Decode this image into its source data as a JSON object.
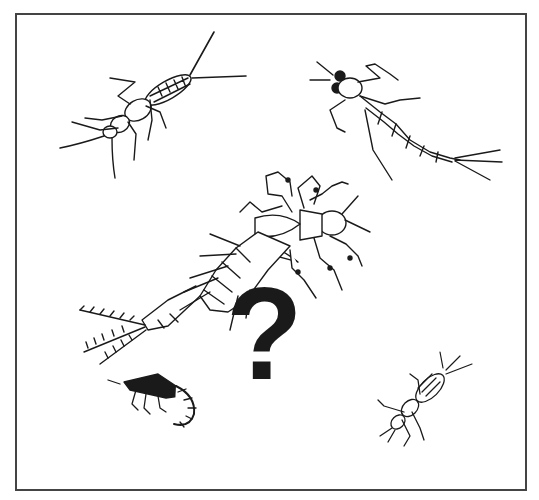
{
  "figure": {
    "symbol": "?",
    "colors": {
      "ink": "#1a1a1a",
      "frame": "#444444",
      "background": "#ffffff"
    },
    "insects": [
      {
        "id": "stonefly-nymph",
        "position": "top-left"
      },
      {
        "id": "mayfly-nymph",
        "position": "top-right"
      },
      {
        "id": "feathered-larva",
        "position": "center"
      },
      {
        "id": "curled-larva",
        "position": "bottom-left"
      },
      {
        "id": "small-nymph",
        "position": "bottom-right"
      }
    ]
  }
}
